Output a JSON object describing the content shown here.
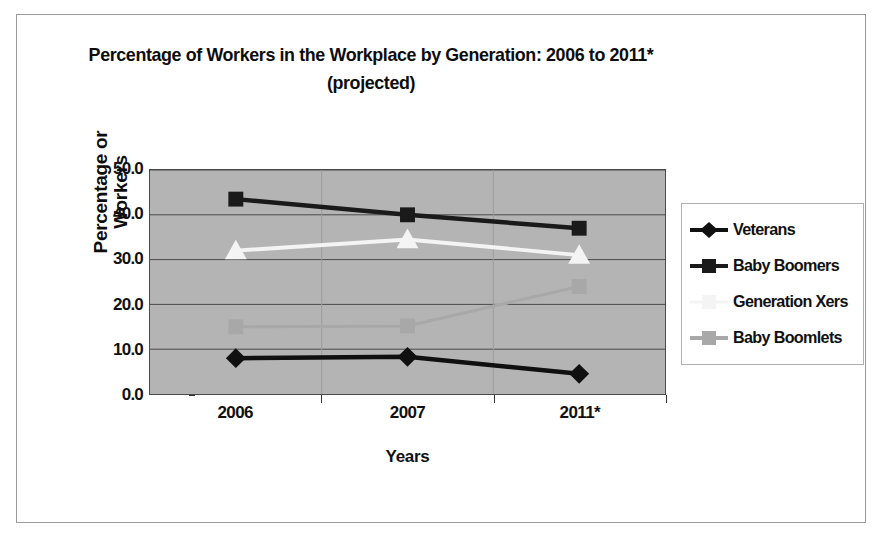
{
  "chart_data": {
    "type": "line",
    "title": "Percentage of Workers in the Workplace by Generation: 2006 to 2011* (projected)",
    "title_line1": "Percentage of Workers in the Workplace by Generation: 2006 to",
    "title_line2": "2011* (projected)",
    "xlabel": "Years",
    "ylabel": "Percentage or Workers",
    "ylabel_line1": "Percentage or",
    "ylabel_line2": "Workers",
    "categories": [
      "2006",
      "2007",
      "2011*"
    ],
    "ylim": [
      0,
      50
    ],
    "ytick_labels": [
      "0.0",
      "10.0",
      "20.0",
      "30.0",
      "40.0",
      "50.0"
    ],
    "ytick_values": [
      0,
      10,
      20,
      30,
      40,
      50
    ],
    "grid": "horizontal",
    "legend_position": "right",
    "plot_background": "#b4b4b4",
    "series": [
      {
        "name": "Veterans",
        "values": [
          8.0,
          8.3,
          4.5
        ],
        "color": "#101010",
        "marker": "diamond"
      },
      {
        "name": "Baby Boomers",
        "values": [
          43.5,
          40.0,
          37.0
        ],
        "color": "#1a1a1a",
        "marker": "square"
      },
      {
        "name": "Generation Xers",
        "values": [
          32.0,
          34.5,
          31.0
        ],
        "color": "#f4f4f4",
        "marker": "triangle"
      },
      {
        "name": "Baby Boomlets",
        "values": [
          15.0,
          15.2,
          24.0
        ],
        "color": "#a8a8a8",
        "marker": "square"
      }
    ]
  }
}
